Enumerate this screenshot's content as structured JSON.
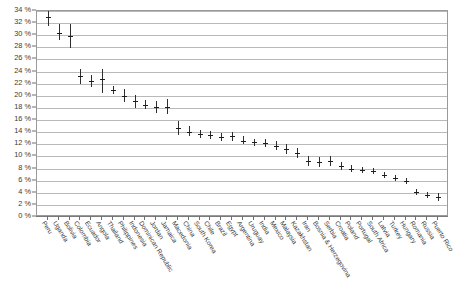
{
  "chart_data": {
    "type": "scatter",
    "title": "",
    "subtitle": "",
    "xlabel": "",
    "ylabel": "",
    "ylim": [
      0,
      34
    ],
    "ytick_labels": [
      "0 %",
      "2 %",
      "4 %",
      "6 %",
      "8 %",
      "10 %",
      "12 %",
      "14 %",
      "16 %",
      "18 %",
      "20 %",
      "22 %",
      "24 %",
      "26 %",
      "28 %",
      "30 %",
      "32 %",
      "34 %"
    ],
    "ytick_values": [
      0,
      2,
      4,
      6,
      8,
      10,
      12,
      14,
      16,
      18,
      20,
      22,
      24,
      26,
      28,
      30,
      32,
      34
    ],
    "grid": true,
    "legend": "none",
    "error_bars": true,
    "categories": [
      "Peru",
      "Uganda",
      "Bolivia",
      "Colombia",
      "Ecuador",
      "Angola",
      "Thailand",
      "Philippines",
      "Indonesia",
      "Dominican Republic",
      "Jordan",
      "Jamaica",
      "Macedonia",
      "China",
      "South Korea",
      "Chile",
      "Brazil",
      "Egypt",
      "Argentina",
      "Uruguay",
      "India",
      "Mexico",
      "Malaysia",
      "Kazakhstan",
      "Iran",
      "Bosnia & Herzegovina",
      "Serbia",
      "Croatia",
      "Poland",
      "Portugal",
      "South Africa",
      "Latvia",
      "Turkey",
      "Hungary",
      "Romania",
      "Russia",
      "Puerto Rico"
    ],
    "values": [
      33.0,
      30.3,
      29.9,
      23.2,
      22.4,
      22.8,
      21.0,
      20.0,
      19.1,
      18.5,
      18.1,
      18.2,
      14.7,
      14.1,
      13.7,
      13.5,
      13.2,
      13.3,
      12.6,
      12.3,
      12.2,
      11.8,
      11.2,
      10.5,
      9.2,
      9.1,
      9.2,
      8.4,
      8.0,
      7.8,
      7.6,
      6.9,
      6.4,
      6.0,
      4.2,
      3.6,
      3.3
    ],
    "ci_low": [
      31.6,
      29.2,
      27.9,
      21.9,
      21.5,
      20.5,
      20.3,
      19.0,
      18.0,
      17.8,
      17.2,
      17.0,
      13.6,
      13.3,
      13.1,
      12.8,
      12.5,
      12.6,
      12.0,
      11.7,
      11.6,
      11.1,
      10.4,
      9.7,
      8.4,
      8.3,
      8.4,
      7.8,
      7.5,
      7.3,
      7.1,
      6.4,
      5.9,
      5.5,
      3.7,
      3.1,
      2.7
    ],
    "ci_high": [
      34.0,
      31.8,
      31.8,
      24.4,
      23.4,
      24.4,
      21.7,
      21.1,
      20.2,
      19.3,
      19.1,
      19.4,
      15.8,
      15.0,
      14.4,
      14.2,
      13.9,
      14.1,
      13.3,
      12.9,
      12.8,
      12.5,
      12.0,
      11.4,
      10.0,
      9.9,
      10.0,
      9.1,
      8.6,
      8.3,
      8.1,
      7.5,
      7.0,
      6.5,
      4.7,
      4.1,
      3.9
    ]
  },
  "colors": {
    "marker": "#1d1d1d",
    "errorbar": "#2d2d2d",
    "gridline": "#b9b9b9",
    "axis": "#7a7a7a",
    "label": "#3a3a3a",
    "background": "#ffffff"
  }
}
